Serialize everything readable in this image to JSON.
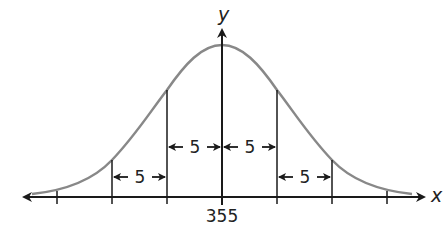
{
  "diagram": {
    "type": "normal-distribution",
    "x_axis_label": "x",
    "y_axis_label": "y",
    "mean_label": "355",
    "mean": 355,
    "std_dev": 5,
    "interval_labels": [
      "5",
      "5",
      "5",
      "5"
    ],
    "colors": {
      "curve": "#888888",
      "axes": "#1a1a1a",
      "text": "#222222"
    }
  }
}
